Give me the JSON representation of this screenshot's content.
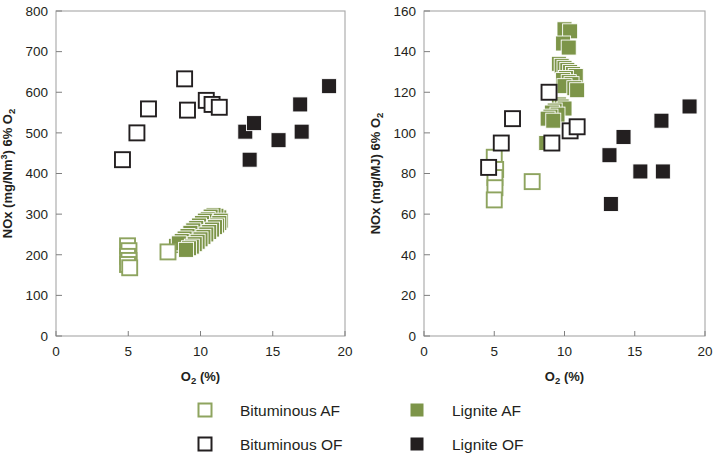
{
  "figure": {
    "background": "#ffffff",
    "marker_colors": {
      "green": "#7d9549",
      "green_edge": "#8ea45f",
      "black": "#231f20",
      "open_fill": "#ffffff"
    }
  },
  "legend": {
    "items": [
      {
        "label": "Bituminous AF",
        "style": "open",
        "color": "#8ea45f",
        "name": "legend-bituminous-af"
      },
      {
        "label": "Lignite AF",
        "style": "filled",
        "color": "#7d9549",
        "name": "legend-lignite-af"
      },
      {
        "label": "Bituminous OF",
        "style": "open",
        "color": "#231f20",
        "name": "legend-bituminous-of"
      },
      {
        "label": "Lignite OF",
        "style": "filled",
        "color": "#231f20",
        "name": "legend-lignite-of"
      }
    ]
  },
  "chart_data": [
    {
      "id": "left",
      "type": "scatter",
      "title": "",
      "xlabel": "O₂ (%)",
      "ylabel": "NOx (mg/Nm³) 6% O₂",
      "xlim": [
        0,
        20
      ],
      "ylim": [
        0,
        800
      ],
      "xticks": [
        0,
        5,
        10,
        15,
        20
      ],
      "yticks": [
        0,
        100,
        200,
        300,
        400,
        500,
        600,
        700,
        800
      ],
      "xtick_labels": [
        "0",
        "5",
        "10",
        "15",
        "20"
      ],
      "ytick_labels": [
        "0",
        "100",
        "200",
        "300",
        "400",
        "500",
        "600",
        "700",
        "800"
      ],
      "grid": false,
      "legend_position": "below-figure",
      "series": [
        {
          "name": "Bituminous AF",
          "style": "open",
          "color": "#8ea45f",
          "points": [
            [
              4.95,
              222
            ],
            [
              5.05,
              210
            ],
            [
              4.95,
              196
            ],
            [
              5.05,
              186
            ],
            [
              4.95,
              176
            ],
            [
              5.1,
              168
            ],
            [
              7.75,
              207
            ]
          ]
        },
        {
          "name": "Lignite AF",
          "style": "filled",
          "color": "#7d9549",
          "points": [
            [
              5.05,
              200
            ],
            [
              5.05,
              190
            ],
            [
              5.1,
              180
            ],
            [
              5.05,
              172
            ],
            [
              8.3,
              222
            ],
            [
              8.5,
              228
            ],
            [
              8.7,
              232
            ],
            [
              8.85,
              236
            ],
            [
              9.0,
              240
            ],
            [
              9.15,
              244
            ],
            [
              9.3,
              248
            ],
            [
              9.45,
              250
            ],
            [
              9.55,
              254
            ],
            [
              9.7,
              258
            ],
            [
              9.85,
              262
            ],
            [
              10.0,
              264
            ],
            [
              10.1,
              268
            ],
            [
              10.25,
              270
            ],
            [
              10.4,
              274
            ],
            [
              10.55,
              276
            ],
            [
              10.65,
              280
            ],
            [
              10.8,
              282
            ],
            [
              10.95,
              286
            ],
            [
              11.05,
              288
            ],
            [
              11.2,
              290
            ],
            [
              11.3,
              292
            ],
            [
              11.1,
              296
            ],
            [
              10.9,
              298
            ],
            [
              10.7,
              294
            ],
            [
              10.5,
              288
            ],
            [
              10.3,
              284
            ],
            [
              10.1,
              278
            ],
            [
              9.9,
              272
            ],
            [
              9.7,
              266
            ],
            [
              9.5,
              260
            ],
            [
              9.3,
              254
            ],
            [
              9.1,
              246
            ],
            [
              8.9,
              240
            ],
            [
              8.7,
              234
            ],
            [
              8.5,
              228
            ],
            [
              11.4,
              284
            ],
            [
              11.3,
              278
            ],
            [
              11.15,
              272
            ],
            [
              11.0,
              268
            ],
            [
              10.8,
              262
            ],
            [
              10.6,
              256
            ],
            [
              10.4,
              250
            ],
            [
              10.2,
              244
            ],
            [
              10.0,
              238
            ],
            [
              9.8,
              232
            ],
            [
              9.6,
              226
            ],
            [
              9.4,
              220
            ],
            [
              9.2,
              216
            ],
            [
              9.0,
              212
            ]
          ]
        },
        {
          "name": "Bituminous OF",
          "style": "open",
          "color": "#231f20",
          "points": [
            [
              4.6,
              434
            ],
            [
              5.6,
              500
            ],
            [
              6.4,
              559
            ],
            [
              8.9,
              633
            ],
            [
              9.1,
              556
            ],
            [
              10.4,
              580
            ],
            [
              10.8,
              570
            ],
            [
              11.3,
              563
            ]
          ]
        },
        {
          "name": "Lignite OF",
          "style": "filled",
          "color": "#231f20",
          "points": [
            [
              13.1,
              503
            ],
            [
              13.4,
              434
            ],
            [
              13.7,
              524
            ],
            [
              15.4,
              482
            ],
            [
              16.9,
              570
            ],
            [
              17.0,
              503
            ],
            [
              18.9,
              615
            ]
          ]
        }
      ]
    },
    {
      "id": "right",
      "type": "scatter",
      "title": "",
      "xlabel": "O₂ (%)",
      "ylabel": "NOx (mg/MJ) 6% O₂",
      "xlim": [
        0,
        20
      ],
      "ylim": [
        0,
        160
      ],
      "xticks": [
        0,
        5,
        10,
        15,
        20
      ],
      "yticks": [
        0,
        20,
        40,
        60,
        80,
        100,
        120,
        140,
        160
      ],
      "xtick_labels": [
        "0",
        "5",
        "10",
        "15",
        "20"
      ],
      "ytick_labels": [
        "0",
        "20",
        "40",
        "60",
        "80",
        "100",
        "120",
        "140",
        "160"
      ],
      "grid": false,
      "legend_position": "below-figure",
      "series": [
        {
          "name": "Bituminous AF",
          "style": "open",
          "color": "#8ea45f",
          "points": [
            [
              5.0,
              88
            ],
            [
              5.1,
              82
            ],
            [
              5.05,
              78
            ],
            [
              5.05,
              73
            ],
            [
              5.0,
              67
            ],
            [
              7.7,
              76
            ]
          ]
        },
        {
          "name": "Lignite AF",
          "style": "filled",
          "color": "#7d9549",
          "points": [
            [
              10.0,
              151
            ],
            [
              10.4,
              150
            ],
            [
              9.9,
              144
            ],
            [
              10.3,
              142
            ],
            [
              9.6,
              134
            ],
            [
              9.8,
              133
            ],
            [
              10.0,
              132
            ],
            [
              10.2,
              131
            ],
            [
              10.4,
              130
            ],
            [
              10.6,
              129
            ],
            [
              10.8,
              128
            ],
            [
              10.1,
              127
            ],
            [
              9.9,
              126
            ],
            [
              10.3,
              125
            ],
            [
              10.5,
              124
            ],
            [
              10.0,
              123
            ],
            [
              10.7,
              122
            ],
            [
              8.9,
              120
            ],
            [
              10.9,
              121
            ],
            [
              9.6,
              114
            ],
            [
              9.8,
              113
            ],
            [
              10.0,
              112
            ],
            [
              9.3,
              111
            ],
            [
              9.1,
              110
            ],
            [
              9.5,
              109
            ],
            [
              9.0,
              108
            ],
            [
              8.8,
              107
            ],
            [
              9.2,
              106
            ],
            [
              8.7,
              95
            ]
          ]
        },
        {
          "name": "Bituminous OF",
          "style": "open",
          "color": "#231f20",
          "points": [
            [
              4.6,
              83
            ],
            [
              5.5,
              95
            ],
            [
              6.3,
              107
            ],
            [
              8.9,
              120
            ],
            [
              9.1,
              95
            ],
            [
              10.4,
              101
            ],
            [
              10.9,
              103
            ]
          ]
        },
        {
          "name": "Lignite OF",
          "style": "filled",
          "color": "#231f20",
          "points": [
            [
              13.2,
              89
            ],
            [
              13.3,
              65
            ],
            [
              14.2,
              98
            ],
            [
              15.4,
              81
            ],
            [
              16.9,
              106
            ],
            [
              17.0,
              81
            ],
            [
              18.9,
              113
            ]
          ]
        }
      ]
    }
  ]
}
